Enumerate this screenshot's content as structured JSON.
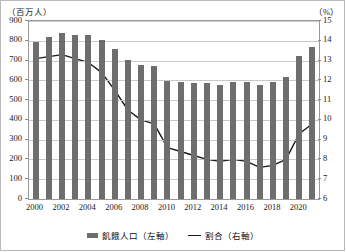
{
  "axes": {
    "left_unit": "（百万人）",
    "right_unit": "（%）"
  },
  "legend": {
    "bar_label": "飢餓人口（左軸）",
    "line_label": "割合（右軸）",
    "bar_icon": "bar-swatch-icon",
    "line_icon": "line-swatch-icon"
  },
  "colors": {
    "bar": "#6e6e6e",
    "line": "#1a1a1a",
    "grid": "#c9c9c9",
    "frame": "#9a9a9a",
    "background": "#ffffff"
  },
  "chart_data": {
    "type": "bar",
    "title": "",
    "subtitle": "",
    "xlabel": "",
    "ylabel": "（百万人）",
    "y2label": "（%）",
    "ylim": [
      0,
      900
    ],
    "y2lim": [
      6,
      15
    ],
    "yticks": [
      0,
      100,
      200,
      300,
      400,
      500,
      600,
      700,
      800,
      900
    ],
    "y2ticks": [
      6,
      7,
      8,
      9,
      10,
      11,
      12,
      13,
      14,
      15
    ],
    "grid": true,
    "legend_position": "bottom",
    "categories": [
      "2000",
      "2001",
      "2002",
      "2003",
      "2004",
      "2005",
      "2006",
      "2007",
      "2008",
      "2009",
      "2010",
      "2011",
      "2012",
      "2013",
      "2014",
      "2015",
      "2016",
      "2017",
      "2018",
      "2019",
      "2020",
      "2021"
    ],
    "xtick_labels": [
      "2000",
      "2002",
      "2004",
      "2006",
      "2008",
      "2010",
      "2012",
      "2014",
      "2016",
      "2018",
      "2020"
    ],
    "series": [
      {
        "name": "飢餓人口（左軸）",
        "type": "bar",
        "axis": "left",
        "unit": "百万人",
        "values": [
          795,
          818,
          838,
          830,
          830,
          806,
          757,
          702,
          678,
          673,
          597,
          592,
          589,
          587,
          576,
          590,
          590,
          575,
          592,
          618,
          721,
          768
        ]
      },
      {
        "name": "割合（右軸）",
        "type": "line",
        "axis": "right",
        "unit": "%",
        "values": [
          13.1,
          13.2,
          13.3,
          13.1,
          12.9,
          12.4,
          11.5,
          10.5,
          10.0,
          9.8,
          8.6,
          8.4,
          8.2,
          8.0,
          7.9,
          8.0,
          7.9,
          7.6,
          7.7,
          8.0,
          9.3,
          9.8
        ]
      }
    ]
  }
}
